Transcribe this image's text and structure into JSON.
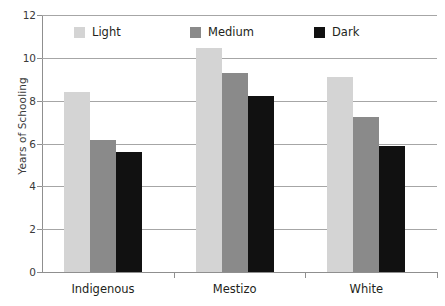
{
  "chart_data": {
    "type": "bar",
    "title": "",
    "subtitle": "",
    "xlabel": "",
    "ylabel": "Years of Schooling",
    "categories": [
      "Indigenous",
      "Mestizo",
      "White"
    ],
    "series": [
      {
        "name": "Light",
        "color": "#d4d4d4",
        "values": [
          8.4,
          10.45,
          9.1
        ]
      },
      {
        "name": "Medium",
        "color": "#8a8a8a",
        "values": [
          6.15,
          9.3,
          7.25
        ]
      },
      {
        "name": "Dark",
        "color": "#111111",
        "values": [
          5.6,
          8.2,
          5.9
        ]
      }
    ],
    "ylim": [
      0,
      12
    ],
    "ytick_values": [
      0,
      2,
      4,
      6,
      8,
      10,
      12
    ],
    "ytick_labels": [
      "0",
      "2",
      "4",
      "6",
      "8",
      "10",
      "12"
    ],
    "grid": true,
    "grid_axis": "y",
    "legend_position": "top-inside",
    "orientation": "vertical",
    "group_mode": "grouped"
  },
  "axes": {
    "y_title": "Years of Schooling",
    "y_ticks": [
      {
        "label": "12",
        "value": 12
      },
      {
        "label": "10",
        "value": 10
      },
      {
        "label": "8",
        "value": 8
      },
      {
        "label": "6",
        "value": 6
      },
      {
        "label": "4",
        "value": 4
      },
      {
        "label": "2",
        "value": 2
      },
      {
        "label": "0",
        "value": 0
      }
    ],
    "x_ticks": [
      {
        "label": "Indigenous"
      },
      {
        "label": "Mestizo"
      },
      {
        "label": "White"
      }
    ]
  },
  "legend": {
    "items": [
      {
        "label": "Light",
        "color": "#d4d4d4"
      },
      {
        "label": "Medium",
        "color": "#8a8a8a"
      },
      {
        "label": "Dark",
        "color": "#111111"
      }
    ]
  },
  "colors": {
    "light": "#d4d4d4",
    "medium": "#8a8a8a",
    "dark": "#111111",
    "axis": "#8f8f8f",
    "grid": "#a6a6a6",
    "text": "#231f20",
    "background": "#ffffff"
  }
}
